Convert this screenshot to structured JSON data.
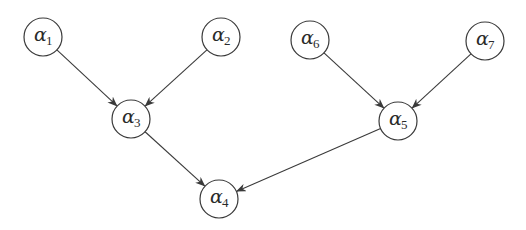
{
  "diagram": {
    "type": "directed-graph",
    "colors": {
      "stroke": "#3a3a3a",
      "background": "#ffffff",
      "text": "#2a2a2a"
    },
    "node_radius": 19,
    "nodes": [
      {
        "id": "a1",
        "symbol": "α",
        "subscript": "1",
        "cx": 43,
        "cy": 37
      },
      {
        "id": "a2",
        "symbol": "α",
        "subscript": "2",
        "cx": 221,
        "cy": 37
      },
      {
        "id": "a3",
        "symbol": "α",
        "subscript": "3",
        "cx": 131,
        "cy": 119
      },
      {
        "id": "a4",
        "symbol": "α",
        "subscript": "4",
        "cx": 219,
        "cy": 199
      },
      {
        "id": "a5",
        "symbol": "α",
        "subscript": "5",
        "cx": 398,
        "cy": 121
      },
      {
        "id": "a6",
        "symbol": "α",
        "subscript": "6",
        "cx": 310,
        "cy": 40
      },
      {
        "id": "a7",
        "symbol": "α",
        "subscript": "7",
        "cx": 485,
        "cy": 41
      }
    ],
    "edges": [
      {
        "from": "a1",
        "to": "a3"
      },
      {
        "from": "a2",
        "to": "a3"
      },
      {
        "from": "a3",
        "to": "a4"
      },
      {
        "from": "a6",
        "to": "a5"
      },
      {
        "from": "a7",
        "to": "a5"
      },
      {
        "from": "a5",
        "to": "a4"
      }
    ]
  }
}
